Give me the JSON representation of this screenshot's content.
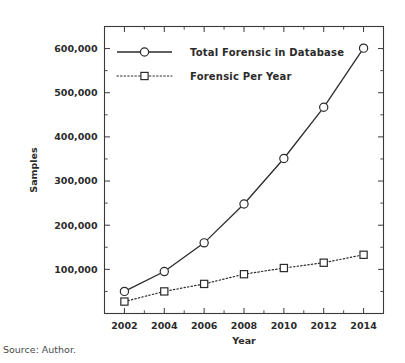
{
  "source_note": "Source: Author.",
  "chart_data": {
    "type": "line",
    "title": "",
    "xlabel": "Year",
    "ylabel": "Samples",
    "x": [
      2002,
      2004,
      2006,
      2008,
      2010,
      2012,
      2014
    ],
    "categories": [
      "2002",
      "2004",
      "2006",
      "2008",
      "2010",
      "2012",
      "2014"
    ],
    "xlim": [
      2001,
      2015
    ],
    "ylim": [
      0,
      650000
    ],
    "xticks": [
      2002,
      2004,
      2006,
      2008,
      2010,
      2012,
      2014
    ],
    "xtick_labels": [
      "2002",
      "2004",
      "2006",
      "2008",
      "2010",
      "2012",
      "2014"
    ],
    "xticks_minor": [
      2003,
      2005,
      2007,
      2009,
      2011,
      2013
    ],
    "yticks": [
      100000,
      200000,
      300000,
      400000,
      500000,
      600000
    ],
    "ytick_labels": [
      "100,000",
      "200,000",
      "300,000",
      "400,000",
      "500,000",
      "600,000"
    ],
    "yticks_minor": [
      50000,
      150000,
      250000,
      350000,
      450000,
      550000,
      650000
    ],
    "grid": false,
    "legend_position": "upper-left-inside",
    "series": [
      {
        "name": "Total Forensic in Database",
        "marker": "circle",
        "linestyle": "solid",
        "values": [
          50000,
          95000,
          160000,
          248000,
          351000,
          467000,
          601000
        ]
      },
      {
        "name": "Forensic Per Year",
        "marker": "square",
        "linestyle": "dotted",
        "values": [
          27000,
          50000,
          67000,
          89000,
          103000,
          115000,
          133000
        ]
      }
    ],
    "colors": {
      "line": "#2b2b2b",
      "axis": "#3a3a3a",
      "marker_fill": "#ffffff",
      "background": "#ffffff"
    }
  }
}
